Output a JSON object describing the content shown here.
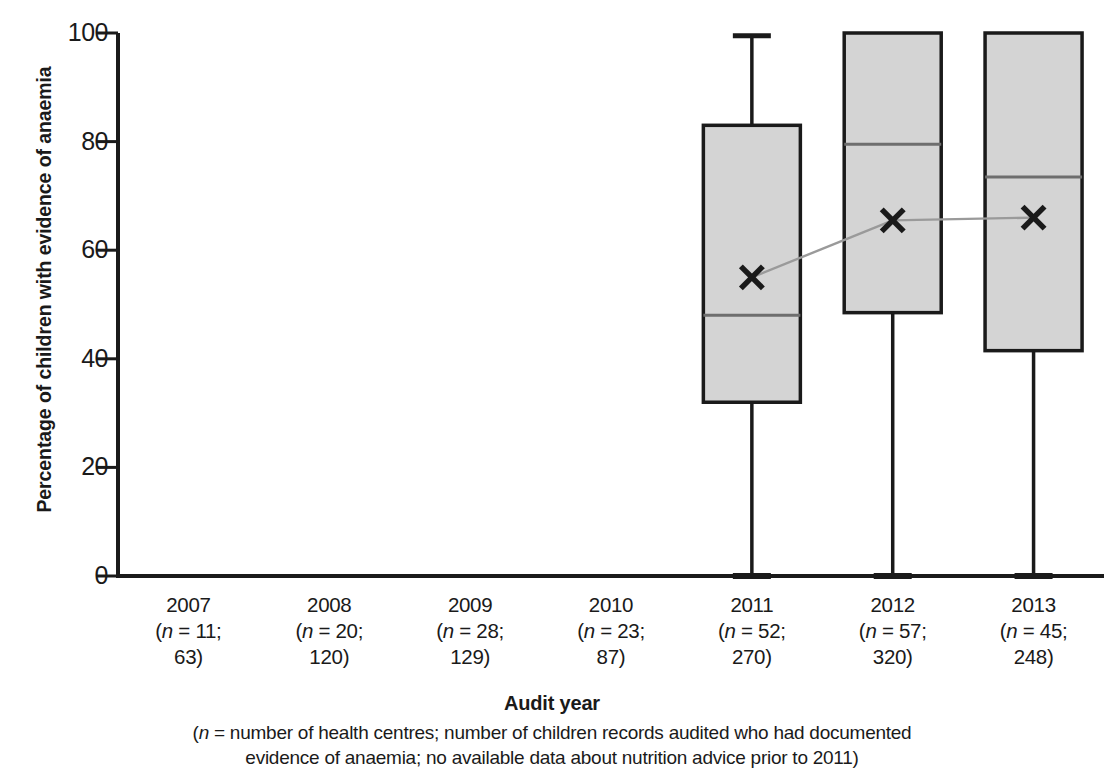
{
  "chart_data": {
    "type": "box",
    "title": "",
    "xlabel": "Audit year",
    "ylabel": "Percentage of children with evidence of anaemia",
    "ylim": [
      0,
      100
    ],
    "ytick_labels": [
      "0",
      "20",
      "40",
      "60",
      "80",
      "100"
    ],
    "ytick_values": [
      0,
      20,
      40,
      60,
      80,
      100
    ],
    "grid": false,
    "legend": "none",
    "categories": [
      "2007",
      "2008",
      "2009",
      "2010",
      "2011",
      "2012",
      "2013"
    ],
    "category_sublabels": [
      {
        "line1": "(n = 11;",
        "line2": "63)"
      },
      {
        "line1": "(n = 20;",
        "line2": "120)"
      },
      {
        "line1": "(n = 28;",
        "line2": "129)"
      },
      {
        "line1": "(n = 23;",
        "line2": "87)"
      },
      {
        "line1": "(n = 52;",
        "line2": "270)"
      },
      {
        "line1": "(n = 57;",
        "line2": "320)"
      },
      {
        "line1": "(n = 45;",
        "line2": "248)"
      }
    ],
    "n_health_centres": [
      11,
      20,
      28,
      23,
      52,
      57,
      45
    ],
    "n_children_records": [
      63,
      120,
      129,
      87,
      270,
      320,
      248
    ],
    "boxes": [
      {
        "category": "2007",
        "has_data": false
      },
      {
        "category": "2008",
        "has_data": false
      },
      {
        "category": "2009",
        "has_data": false
      },
      {
        "category": "2010",
        "has_data": false
      },
      {
        "category": "2011",
        "has_data": true,
        "whisker_low": 0,
        "q1": 32,
        "median": 48,
        "q3": 83,
        "whisker_high": 99.5,
        "mean": 55
      },
      {
        "category": "2012",
        "has_data": true,
        "whisker_low": 0,
        "q1": 48.5,
        "median": 79.5,
        "q3": 100,
        "whisker_high": 100,
        "mean": 65.5
      },
      {
        "category": "2013",
        "has_data": true,
        "whisker_low": 0,
        "q1": 41.5,
        "median": 73.5,
        "q3": 100,
        "whisker_high": 100,
        "mean": 66
      }
    ],
    "mean_marker": "x",
    "mean_series_name": "mean",
    "colors": {
      "box_fill": "#d4d4d4",
      "box_stroke": "#1a1a1a",
      "median_line": "#6e6e6e",
      "whisker": "#1a1a1a",
      "mean_marker": "#1a1a1a",
      "mean_connector": "#9a9a9a",
      "axis": "#1a1a1a",
      "text": "#1a1a1a",
      "background": "#ffffff"
    }
  },
  "axis": {
    "x_title": "Audit year",
    "caption_line_1": "(n = number of health centres; number of children records audited who had documented",
    "caption_line_2": "evidence of anaemia; no available data about nutrition advice prior to 2011)"
  }
}
